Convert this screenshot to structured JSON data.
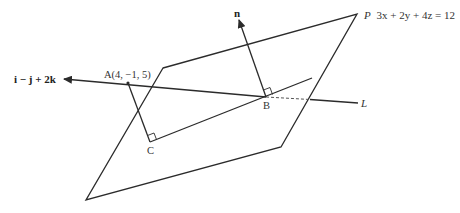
{
  "diagram": {
    "colors": {
      "stroke": "#2b2b2b",
      "text": "#333333",
      "background": "#ffffff"
    },
    "plane": {
      "name": "P",
      "equation": "3x + 2y + 4z = 12",
      "label": "P 3x + 2y + 4z = 12"
    },
    "normal": {
      "label": "n"
    },
    "direction_vector": {
      "label": "i − j + 2k"
    },
    "points": {
      "A": {
        "label": "A(4, −1, 5)"
      },
      "B": {
        "label": "B"
      },
      "C": {
        "label": "C"
      }
    },
    "line": {
      "label": "L"
    }
  }
}
